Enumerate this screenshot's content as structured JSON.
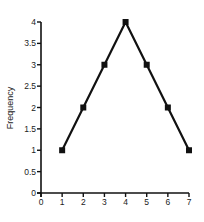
{
  "chart_data": {
    "type": "line",
    "title": "",
    "xlabel": "",
    "ylabel": "Frequency",
    "x": [
      1,
      2,
      3,
      4,
      5,
      6,
      7
    ],
    "series": [
      {
        "name": "Frequency",
        "values": [
          1,
          2,
          3,
          4,
          3,
          2,
          1
        ],
        "marker": "square",
        "color": "#111111"
      }
    ],
    "xlim": [
      0,
      7
    ],
    "ylim": [
      0,
      4
    ],
    "x_ticks": [
      "0",
      "1",
      "2",
      "3",
      "4",
      "5",
      "6",
      "7"
    ],
    "y_ticks": [
      "0",
      "0.5",
      "1",
      "1.5",
      "2",
      "2.5",
      "3",
      "3.5",
      "4"
    ],
    "grid": false,
    "legend": null
  }
}
